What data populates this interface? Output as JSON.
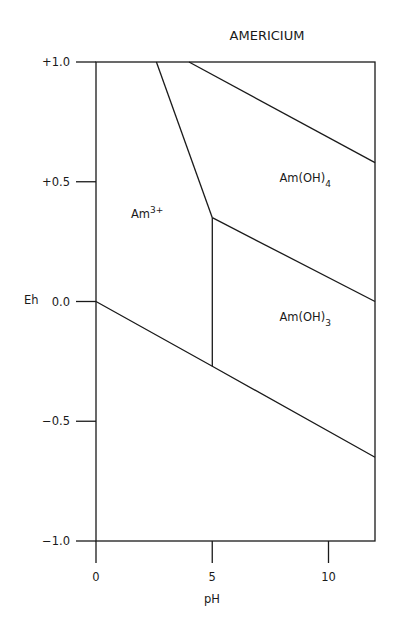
{
  "chart_data": {
    "type": "line",
    "title": "AMERICIUM",
    "xlabel": "pH",
    "ylabel": "Eh",
    "xlim": [
      0,
      12
    ],
    "ylim": [
      -1.0,
      1.0
    ],
    "grid": false,
    "x_ticks": [
      {
        "value": 0,
        "label": "0"
      },
      {
        "value": 5,
        "label": "5"
      },
      {
        "value": 10,
        "label": "10"
      }
    ],
    "y_ticks": [
      {
        "value": 1.0,
        "label": "+1.0"
      },
      {
        "value": 0.5,
        "label": "+0.5"
      },
      {
        "value": 0.0,
        "label": "0.0"
      },
      {
        "value": -0.5,
        "label": "−0.5"
      },
      {
        "value": -1.0,
        "label": "−1.0"
      }
    ],
    "series": [
      {
        "name": "water-reduction-boundary",
        "points": [
          [
            0,
            0.0
          ],
          [
            5,
            -0.27
          ],
          [
            12,
            -0.65
          ]
        ]
      },
      {
        "name": "Am3+/Am(OH)3-boundary",
        "points": [
          [
            5,
            -0.27
          ],
          [
            5,
            0.35
          ]
        ]
      },
      {
        "name": "Am3+/Am(OH)4-boundary",
        "points": [
          [
            2.6,
            1.0
          ],
          [
            5,
            0.35
          ]
        ]
      },
      {
        "name": "Am(OH)4/Am(OH)3-boundary",
        "points": [
          [
            5,
            0.35
          ],
          [
            12,
            0.0
          ]
        ]
      },
      {
        "name": "upper-boundary",
        "points": [
          [
            4.0,
            1.0
          ],
          [
            12,
            0.58
          ]
        ]
      }
    ],
    "regions": [
      {
        "base": "Am",
        "sup": "3+",
        "sub": "",
        "label": "Am3+",
        "x": 2.2,
        "y": 0.35
      },
      {
        "base": "Am(OH)",
        "sup": "",
        "sub": "4",
        "label": "Am(OH)4",
        "x": 9.0,
        "y": 0.5
      },
      {
        "base": "Am(OH)",
        "sup": "",
        "sub": "3",
        "label": "Am(OH)3",
        "x": 9.0,
        "y": -0.08
      }
    ],
    "line_color": "#1a1a1a"
  }
}
